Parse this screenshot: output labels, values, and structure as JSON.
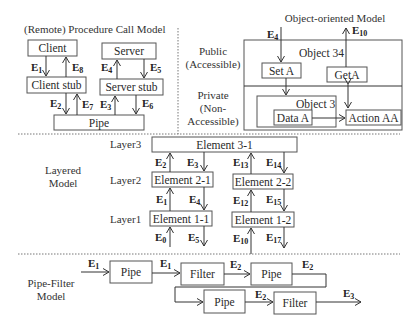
{
  "rpc": {
    "title": "(Remote) Procedure Call Model",
    "client": "Client",
    "server": "Server",
    "client_stub": "Client stub",
    "server_stub": "Server stub",
    "pipe": "Pipe",
    "events": {
      "e1": {
        "b": "E",
        "s": "1"
      },
      "e8": {
        "b": "E",
        "s": "8"
      },
      "e4": {
        "b": "E",
        "s": "4"
      },
      "e5": {
        "b": "E",
        "s": "5"
      },
      "e2": {
        "b": "E",
        "s": "2"
      },
      "e7": {
        "b": "E",
        "s": "7"
      },
      "e3": {
        "b": "E",
        "s": "3"
      },
      "e6": {
        "b": "E",
        "s": "6"
      }
    }
  },
  "oo": {
    "title": "Object-oriented Model",
    "public_label_1": "Public",
    "public_label_2": "(Accessible)",
    "private_label_1": "Private",
    "private_label_2": "(Non-",
    "private_label_3": "Accessible)",
    "object34": "Object 34",
    "set_a": "Set A",
    "get_a": "GetA",
    "object3": "Object 3",
    "data_a": "Data A",
    "action_aa": "Action AA",
    "events": {
      "e4": {
        "b": "E",
        "s": "4"
      },
      "e10": {
        "b": "E",
        "s": "10"
      }
    }
  },
  "layered": {
    "title_1": "Layered",
    "title_2": "Model",
    "layer3": "Layer3",
    "layer2": "Layer2",
    "layer1": "Layer1",
    "el31": "Element 3-1",
    "el21": "Element 2-1",
    "el22": "Element 2-2",
    "el11": "Element 1-1",
    "el12": "Element 1-2",
    "events": {
      "e2": {
        "b": "E",
        "s": "2"
      },
      "e3": {
        "b": "E",
        "s": "3"
      },
      "e1": {
        "b": "E",
        "s": "1"
      },
      "e4": {
        "b": "E",
        "s": "4"
      },
      "e0": {
        "b": "E",
        "s": "0"
      },
      "e5": {
        "b": "E",
        "s": "5"
      },
      "e13": {
        "b": "E",
        "s": "13"
      },
      "e14": {
        "b": "E",
        "s": "14"
      },
      "e12": {
        "b": "E",
        "s": "12"
      },
      "e15": {
        "b": "E",
        "s": "15"
      },
      "e10": {
        "b": "E",
        "s": "10"
      },
      "e17": {
        "b": "E",
        "s": "17"
      }
    }
  },
  "pipefilter": {
    "title_1": "Pipe-Filter",
    "title_2": "Model",
    "pipe1": "Pipe",
    "filter1": "Filter",
    "pipe2": "Pipe",
    "pipe3": "Pipe",
    "filter2": "Filter",
    "events": {
      "in": {
        "b": "E",
        "s": "1"
      },
      "p1f1": {
        "b": "E",
        "s": "1"
      },
      "f1p2": {
        "b": "E",
        "s": "2"
      },
      "p2out": {
        "b": "E",
        "s": "2"
      },
      "p3f2": {
        "b": "E",
        "s": "2"
      },
      "out": {
        "b": "E",
        "s": "3"
      }
    }
  }
}
